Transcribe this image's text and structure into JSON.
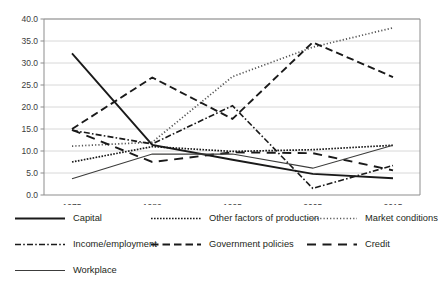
{
  "chart_data": {
    "type": "line",
    "title": "",
    "xlabel": "",
    "ylabel": "",
    "categories": [
      "1975",
      "1982",
      "1995",
      "2005",
      "2015"
    ],
    "ylim": [
      0,
      40
    ],
    "ytick_labels": [
      "0.0",
      "5.0",
      "10.0",
      "15.0",
      "20.0",
      "25.0",
      "30.0",
      "35.0",
      "40.0"
    ],
    "yticks": [
      0,
      5,
      10,
      15,
      20,
      25,
      30,
      35,
      40
    ],
    "grid": "horizontal",
    "legend_position": "bottom",
    "series": [
      {
        "name": "Capital",
        "style": "solid",
        "width": 1.9,
        "color": "#1a1a1a",
        "values": [
          32.2,
          11.4,
          8.0,
          4.8,
          3.8
        ]
      },
      {
        "name": "Other factors of production",
        "style": "fine-dotted",
        "width": 1.7,
        "color": "#1a1a1a",
        "values": [
          7.5,
          11.0,
          9.9,
          10.3,
          11.3
        ]
      },
      {
        "name": "Market conditions",
        "style": "dotted",
        "width": 1.7,
        "color": "#555555",
        "values": [
          11.1,
          12.0,
          26.9,
          33.6,
          38.0
        ]
      },
      {
        "name": "Income/employment",
        "style": "dash-dot",
        "width": 1.6,
        "color": "#1a1a1a",
        "values": [
          14.7,
          11.6,
          20.3,
          1.5,
          6.7
        ]
      },
      {
        "name": "Government policies",
        "style": "dashed",
        "width": 1.9,
        "color": "#1a1a1a",
        "values": [
          15.0,
          26.7,
          17.3,
          34.7,
          26.8
        ]
      },
      {
        "name": "Credit",
        "style": "long-dash",
        "width": 1.9,
        "color": "#1a1a1a",
        "values": [
          14.8,
          7.5,
          9.7,
          9.5,
          5.6
        ]
      },
      {
        "name": "Workplace",
        "style": "thin-solid",
        "width": 1.1,
        "color": "#3c3c3b",
        "values": [
          3.7,
          9.3,
          9.3,
          6.1,
          11.3
        ]
      }
    ]
  },
  "legend": {
    "rows": [
      [
        {
          "label": "Capital",
          "key": "capital"
        },
        {
          "label": "Other factors of production",
          "key": "other-factors-of-production"
        },
        {
          "label": "Market conditions",
          "key": "market-conditions"
        }
      ],
      [
        {
          "label": "Income/employment",
          "key": "income-employment"
        },
        {
          "label": "Government policies",
          "key": "government-policies"
        },
        {
          "label": "Credit",
          "key": "credit"
        }
      ],
      [
        {
          "label": "Workplace",
          "key": "workplace"
        }
      ]
    ]
  }
}
